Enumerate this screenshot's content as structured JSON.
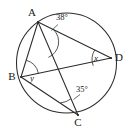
{
  "figure": {
    "type": "circle-geometry-diagram",
    "background_color": "#ffffff",
    "stroke_color": "#2b2b2b",
    "circle": {
      "center_x": 66.5,
      "center_y": 63,
      "radius": 50
    },
    "points": [
      {
        "id": "A",
        "label": "A",
        "x": 38,
        "y": 22,
        "label_x": 32,
        "label_y": 16
      },
      {
        "id": "B",
        "label": "B",
        "x": 21,
        "y": 77,
        "label_x": 12,
        "label_y": 80
      },
      {
        "id": "C",
        "label": "C",
        "x": 78,
        "y": 115,
        "label_x": 78,
        "label_y": 126
      },
      {
        "id": "D",
        "label": "D",
        "x": 111,
        "y": 58,
        "label_x": 119,
        "label_y": 61
      }
    ],
    "chords": [
      {
        "id": "AD",
        "from": "A",
        "to": "D"
      },
      {
        "id": "AC",
        "from": "A",
        "to": "C"
      },
      {
        "id": "BA",
        "from": "B",
        "to": "A"
      },
      {
        "id": "BD",
        "from": "B",
        "to": "D"
      },
      {
        "id": "BC",
        "from": "B",
        "to": "C"
      }
    ],
    "angles": [
      {
        "id": "angle-at-A",
        "vertex": "A",
        "label": "38°",
        "label_x": 62,
        "label_y": 20,
        "between": [
          "AD",
          "AC"
        ]
      },
      {
        "id": "angle-at-D",
        "vertex": "D",
        "label": "x",
        "label_x": 96,
        "label_y": 61,
        "between": [
          "DA",
          "DB"
        ]
      },
      {
        "id": "angle-at-B",
        "vertex": "B",
        "label": "y",
        "label_x": 32,
        "label_y": 81,
        "between": [
          "BA",
          "BD"
        ]
      },
      {
        "id": "angle-at-C",
        "vertex": "C",
        "label": "35°",
        "label_x": 82,
        "label_y": 92,
        "between": [
          "CA",
          "CB"
        ]
      }
    ]
  }
}
